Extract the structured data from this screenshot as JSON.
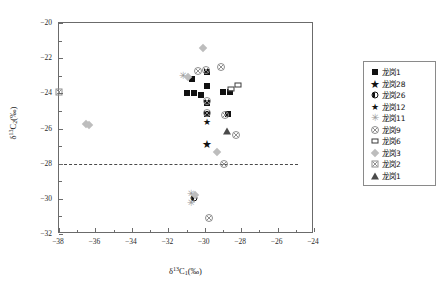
{
  "chart_data": {
    "type": "scatter",
    "title": "",
    "xlabel": "δ13C1(‰)",
    "ylabel": "δ13C2(‰)",
    "xlim": [
      -38,
      -24
    ],
    "ylim": [
      -32,
      -20
    ],
    "xticks": [
      -38,
      -36,
      -34,
      -32,
      -30,
      -28,
      -26,
      -24
    ],
    "yticks": [
      -20,
      -22,
      -24,
      -26,
      -28,
      -30,
      -32
    ],
    "grid": false,
    "legend_position": "right",
    "annotations": [
      {
        "type": "reference-line",
        "orientation": "horizontal",
        "value": -28,
        "style": "dashed",
        "x_extent": [
          -38,
          -24.9
        ]
      }
    ],
    "series": [
      {
        "name": "龙岗1",
        "marker": "filled-square",
        "color": "#111111",
        "points": [
          [
            -30.7,
            -23.2
          ],
          [
            -31.0,
            -24.0
          ],
          [
            -30.6,
            -24.0
          ],
          [
            -29.9,
            -22.8
          ],
          [
            -29.9,
            -23.6
          ],
          [
            -30.2,
            -24.1
          ],
          [
            -29.85,
            -24.55
          ],
          [
            -29.9,
            -25.2
          ],
          [
            -28.7,
            -25.2
          ],
          [
            -29.0,
            -23.9
          ],
          [
            -28.6,
            -23.95
          ]
        ]
      },
      {
        "name": "龙岗28",
        "marker": "filled-star",
        "color": "#111111",
        "points": [
          [
            -29.85,
            -26.9
          ]
        ]
      },
      {
        "name": "龙岗26",
        "marker": "half-filled-circle",
        "color": "#111111",
        "points": [
          [
            -30.6,
            -29.95
          ]
        ]
      },
      {
        "name": "龙岗12",
        "marker": "filled-star-small",
        "color": "#111111",
        "points": [
          [
            -29.9,
            -25.65
          ]
        ]
      },
      {
        "name": "龙岗11",
        "marker": "asterisk",
        "color": "#9a9a9a",
        "points": [
          [
            -31.2,
            -23.0
          ],
          [
            -30.75,
            -29.75
          ],
          [
            -30.75,
            -30.25
          ]
        ]
      },
      {
        "name": "龙岗9",
        "marker": "circle-x",
        "color": "#8e8e8e",
        "points": [
          [
            -30.35,
            -22.75
          ],
          [
            -29.95,
            -22.65
          ],
          [
            -29.1,
            -22.5
          ],
          [
            -29.9,
            -24.45
          ],
          [
            -29.9,
            -25.1
          ],
          [
            -28.9,
            -25.25
          ],
          [
            -28.3,
            -26.35
          ],
          [
            -28.95,
            -28.0
          ],
          [
            -29.75,
            -31.1
          ]
        ]
      },
      {
        "name": "龙岗6",
        "marker": "dashed-box",
        "color": "#3a3a3a",
        "points": [
          [
            -28.55,
            -23.75
          ],
          [
            -28.15,
            -23.55
          ]
        ]
      },
      {
        "name": "龙岗3",
        "marker": "diamond",
        "color": "#bdbdbd",
        "points": [
          [
            -30.1,
            -21.45
          ],
          [
            -30.9,
            -23.05
          ],
          [
            -36.5,
            -25.75
          ],
          [
            -36.35,
            -25.8
          ],
          [
            -29.3,
            -27.35
          ],
          [
            -30.55,
            -29.8
          ]
        ]
      },
      {
        "name": "龙岗2",
        "marker": "square-x",
        "color": "#8e8e8e",
        "points": [
          [
            -38.0,
            -23.95
          ]
        ]
      },
      {
        "name": "龙岗1",
        "marker": "filled-triangle",
        "color": "#4a4a4a",
        "points": [
          [
            -28.75,
            -26.15
          ]
        ]
      }
    ]
  },
  "axes": {
    "x_title_parts": {
      "delta": "δ",
      "sup": "13",
      "c": "C",
      "sub": "1",
      "unit": "(‰)"
    },
    "y_title_parts": {
      "delta": "δ",
      "sup": "13",
      "c": "C",
      "sub": "2",
      "unit": "(‰)"
    }
  },
  "legend": {
    "items": [
      {
        "label": "龙岗1",
        "marker": "filled-square"
      },
      {
        "label": "龙岗28",
        "marker": "filled-star"
      },
      {
        "label": "龙岗26",
        "marker": "half-filled-circle"
      },
      {
        "label": "龙岗12",
        "marker": "filled-star-small"
      },
      {
        "label": "龙岗11",
        "marker": "asterisk"
      },
      {
        "label": "龙岗9",
        "marker": "circle-x"
      },
      {
        "label": "龙岗6",
        "marker": "dashed-box"
      },
      {
        "label": "龙岗3",
        "marker": "diamond"
      },
      {
        "label": "龙岗2",
        "marker": "square-x"
      },
      {
        "label": "龙岗1",
        "marker": "filled-triangle"
      }
    ]
  }
}
